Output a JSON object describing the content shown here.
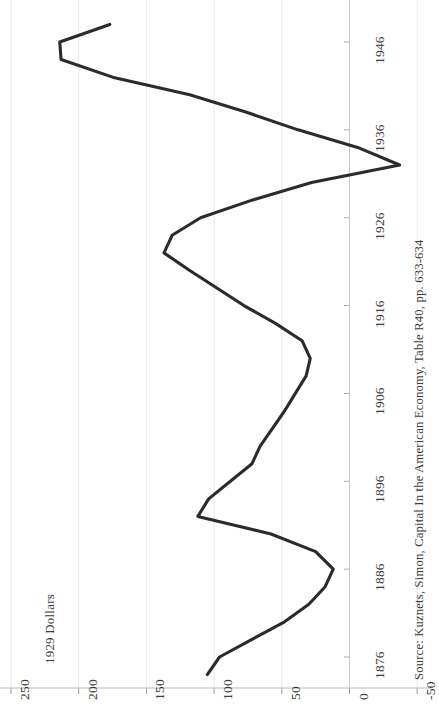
{
  "figure": {
    "axis_title": "1929 Dollars",
    "source_note": "Source: Kuznets, Simon, Capital In the American Economy, Table R40, pp. 633-634",
    "orientation": "rotated-90",
    "line_color": "#2b2b2b",
    "gridline_color": "#e8e8ea",
    "axis_color": "#c9c9cd",
    "text_color": "#3a3a3a"
  },
  "chart_data": {
    "type": "line",
    "title": "",
    "subtitle": "",
    "xlabel": "",
    "ylabel": "1929 Dollars",
    "orientation": "horizontal-rotated",
    "grid": true,
    "legend": "none",
    "annotations": [
      "Source: Kuznets, Simon, Capital In the American Economy, Table R40, pp. 633-634"
    ],
    "xlim": [
      1874,
      1948
    ],
    "ylim": [
      -50,
      250
    ],
    "x_tick_labels": [
      "1876",
      "1886",
      "1896",
      "1906",
      "1916",
      "1926",
      "1936",
      "1946"
    ],
    "x_ticks": [
      1876,
      1886,
      1896,
      1906,
      1916,
      1926,
      1936,
      1946
    ],
    "y_tick_labels": [
      "250",
      "200",
      "150",
      "100",
      "50",
      "0",
      "-50"
    ],
    "y_ticks": [
      250,
      200,
      150,
      100,
      50,
      0,
      -50
    ],
    "series": [
      {
        "name": "Net Capital Formation (1929 Dollars)",
        "x": [
          1874,
          1876,
          1878,
          1880,
          1882,
          1884,
          1886,
          1888,
          1890,
          1892,
          1894,
          1896,
          1898,
          1900,
          1902,
          1904,
          1906,
          1908,
          1910,
          1912,
          1914,
          1916,
          1918,
          1920,
          1922,
          1924,
          1926,
          1928,
          1930,
          1932,
          1934,
          1936,
          1938,
          1940,
          1942,
          1944,
          1946,
          1948
        ],
        "values": [
          105,
          96,
          72,
          48,
          30,
          18,
          12,
          25,
          58,
          112,
          104,
          88,
          72,
          66,
          57,
          48,
          40,
          32,
          29,
          35,
          55,
          78,
          98,
          118,
          137,
          131,
          110,
          72,
          28,
          -37,
          -6,
          38,
          76,
          118,
          175,
          213,
          214,
          177
        ]
      }
    ]
  },
  "value_axis": {
    "ticks": [
      {
        "label": "250",
        "value": 250
      },
      {
        "label": "200",
        "value": 200
      },
      {
        "label": "150",
        "value": 150
      },
      {
        "label": "100",
        "value": 100
      },
      {
        "label": "50",
        "value": 50
      },
      {
        "label": "0",
        "value": 0
      },
      {
        "label": "-50",
        "value": -50
      }
    ]
  },
  "year_axis": {
    "ticks": [
      {
        "label": "1876",
        "value": 1876
      },
      {
        "label": "1886",
        "value": 1886
      },
      {
        "label": "1896",
        "value": 1896
      },
      {
        "label": "1906",
        "value": 1906
      },
      {
        "label": "1916",
        "value": 1916
      },
      {
        "label": "1926",
        "value": 1926
      },
      {
        "label": "1936",
        "value": 1936
      },
      {
        "label": "1946",
        "value": 1946
      }
    ]
  }
}
